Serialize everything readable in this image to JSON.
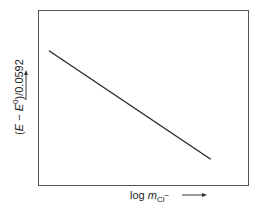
{
  "chart_data": {
    "type": "line",
    "title": "",
    "xlabel": "log m_Cl⁻ →",
    "ylabel": "(E − E⁰)/0.0592 →",
    "grid": false,
    "legend": null,
    "axis_ticks": false,
    "series": [
      {
        "name": "(E − E⁰)/0.0592 vs log m_Cl⁻",
        "x": [
          0.05,
          0.82
        ],
        "y": [
          0.77,
          0.15
        ],
        "note": "Schematic straight line with negative slope; axes unlabeled by numbers (normalized 0–1 coords)"
      }
    ],
    "xlim": [
      0,
      1
    ],
    "ylim": [
      0,
      1
    ]
  },
  "labels": {
    "y_prefix": "(",
    "y_E": "E",
    "y_minus": " − ",
    "y_E0": "E",
    "y_sup": "0",
    "y_suffix": ")/0.0592",
    "x_log": "log ",
    "x_m": "m",
    "x_sub": "Cl",
    "x_sub_sup": "−"
  },
  "colors": {
    "line": "#2a2a2a",
    "frame": "#555555"
  }
}
